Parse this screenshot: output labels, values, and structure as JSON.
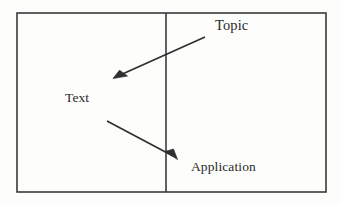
{
  "diagram": {
    "background_color": "#fdfdfc",
    "stroke_color": "#3a3a3a",
    "text_color": "#2a2a2a",
    "frame": {
      "name": "outer-rectangle",
      "x": 17,
      "y": 13,
      "width": 309,
      "height": 179,
      "stroke_width": 1.6
    },
    "divider": {
      "name": "vertical-divider-line",
      "x": 166,
      "y1": 13,
      "y2": 192,
      "stroke_width": 1.6
    },
    "labels": [
      {
        "id": "topic",
        "text": "Topic",
        "x": 215,
        "y": 18,
        "font_size": 14.5
      },
      {
        "id": "text",
        "text": "Text",
        "x": 65,
        "y": 91,
        "font_size": 13.5
      },
      {
        "id": "application",
        "text": "Application",
        "x": 191,
        "y": 160,
        "font_size": 13.5
      }
    ],
    "arrows": [
      {
        "id": "topic-to-text",
        "from_label": "Topic",
        "to_label": "Text",
        "x1": 205,
        "y1": 37,
        "x2": 114,
        "y2": 78,
        "direction": "down-left",
        "stroke_width": 1.6
      },
      {
        "id": "text-to-application",
        "from_label": "Text",
        "to_label": "Application",
        "x1": 107,
        "y1": 121,
        "x2": 177,
        "y2": 159,
        "direction": "down-right",
        "stroke_width": 1.6
      }
    ]
  }
}
